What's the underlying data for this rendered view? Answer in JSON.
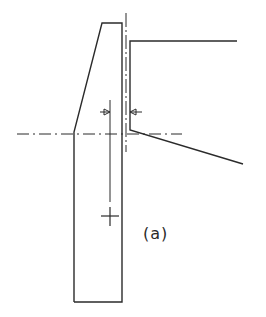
{
  "figure": {
    "label": "(a)",
    "colors": {
      "stroke": "#2b2b2b",
      "background": "#ffffff"
    },
    "elements": {
      "pier_outline": "tapered pier with sloped left face",
      "deck": "horizontal deck top with sloped underside",
      "centerline_vertical": "dash-dot vertical axis",
      "centerline_horizontal": "dash-dot horizontal axis",
      "dimension_arrows": "two inward-pointing arrows indicating gap",
      "center_marker": "plus sign marking centroid",
      "reference_line": "vertical line from arrows to centroid"
    }
  }
}
